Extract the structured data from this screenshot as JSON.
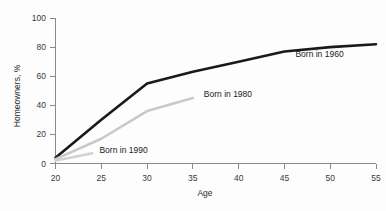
{
  "chart_data": {
    "type": "line",
    "title": "",
    "xlabel": "Age",
    "ylabel": "Homeowners, %",
    "xlim": [
      20,
      55
    ],
    "ylim": [
      0,
      100
    ],
    "grid": false,
    "legend_position": "inline-annotations",
    "xticks": [
      "20",
      "25",
      "30",
      "35",
      "40",
      "45",
      "50",
      "55"
    ],
    "yticks": [
      "0",
      "20",
      "40",
      "60",
      "80",
      "100"
    ],
    "series": [
      {
        "name": "Born in 1960",
        "color": "#1a1a1a",
        "width": 2.6,
        "label": "Born in 1960",
        "label_x": 46.2,
        "label_y": 75,
        "x": [
          20,
          25,
          30,
          35,
          40,
          45,
          50,
          55
        ],
        "values": [
          4,
          30,
          55,
          63,
          70,
          77,
          80,
          82
        ]
      },
      {
        "name": "Born in 1980",
        "color": "#c9c9c9",
        "width": 2.6,
        "label": "Born in 1980",
        "label_x": 36.2,
        "label_y": 48,
        "x": [
          20,
          25,
          30,
          35
        ],
        "values": [
          3,
          17,
          36,
          45
        ]
      },
      {
        "name": "Born in 1990",
        "color": "#d2d2d2",
        "width": 2.6,
        "label": "Born in 1990",
        "label_x": 24.8,
        "label_y": 9,
        "x": [
          20,
          22,
          24
        ],
        "values": [
          2,
          4.5,
          7
        ]
      }
    ]
  },
  "labels": {
    "y_axis_title": "Homeowners, %",
    "x_axis_title": "Age",
    "series_1960": "Born in 1960",
    "series_1980": "Born in 1980",
    "series_1990": "Born in 1990",
    "ytick_0": "0",
    "ytick_20": "20",
    "ytick_40": "40",
    "ytick_60": "60",
    "ytick_80": "80",
    "ytick_100": "100",
    "xtick_20": "20",
    "xtick_25": "25",
    "xtick_30": "30",
    "xtick_35": "35",
    "xtick_40": "40",
    "xtick_45": "45",
    "xtick_50": "50",
    "xtick_55": "55"
  }
}
